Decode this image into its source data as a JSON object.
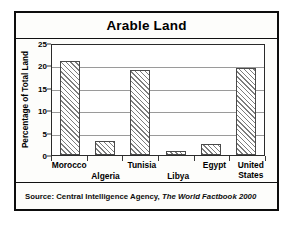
{
  "figure": {
    "title": "Arable Land",
    "source_prefix": "Source: Central Intelligence Agency,",
    "source_publication": "The World Factbook 2000"
  },
  "chart_data": {
    "type": "bar",
    "title": "Arable Land",
    "xlabel": "",
    "ylabel": "Percentage of Total Land",
    "categories": [
      "Morocco",
      "Algeria",
      "Tunisia",
      "Libya",
      "Egypt",
      "United States"
    ],
    "values": [
      21,
      3.2,
      19,
      1,
      2.5,
      19.5
    ],
    "ylim": [
      0,
      25
    ],
    "yticks": [
      0,
      5,
      10,
      15,
      20,
      25
    ],
    "ytick_labels": [
      "0",
      "5",
      "10",
      "15",
      "20",
      "25"
    ],
    "grid": true,
    "legend": null,
    "legend_position": "none",
    "bar_fill": "diagonal-hatch",
    "colors": {
      "bar_hatch": "#7d7d7d",
      "bar_outline": "#4a4a4a",
      "gridline": "#9a9a9a",
      "axis": "#2b2b2b",
      "frame": "#0d0d0d",
      "background": "#fdfdfb",
      "text": "#000000"
    },
    "category_label_rows": [
      "top",
      "bottom",
      "top",
      "bottom",
      "top",
      "top"
    ]
  }
}
